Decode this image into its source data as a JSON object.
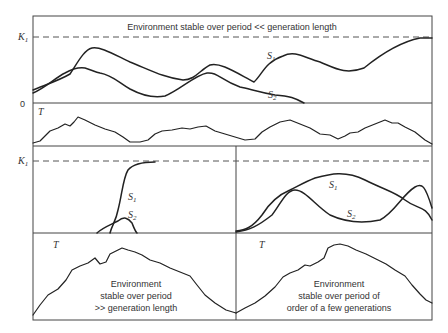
{
  "figure": {
    "top_panel": {
      "caption": "Environment stable over period << generation length",
      "y_labels": {
        "k": "K",
        "k_sub": "1",
        "zero": "0"
      },
      "series_labels": [
        {
          "name": "S",
          "sub": "1"
        },
        {
          "name": "S",
          "sub": "2"
        }
      ],
      "env_label": "T"
    },
    "left_panel": {
      "y_label": {
        "k": "K",
        "k_sub": "1"
      },
      "series_labels": [
        {
          "name": "S",
          "sub": "1"
        },
        {
          "name": "S",
          "sub": "2"
        }
      ],
      "env_label": "T",
      "caption_lines": [
        "Environment",
        "stable over period",
        ">> generation length"
      ]
    },
    "right_panel": {
      "series_labels": [
        {
          "name": "S",
          "sub": "1"
        },
        {
          "name": "S",
          "sub": "2"
        }
      ],
      "env_label": "T",
      "caption_lines": [
        "Environment",
        "stable over period of",
        "order of a few generations"
      ]
    }
  }
}
